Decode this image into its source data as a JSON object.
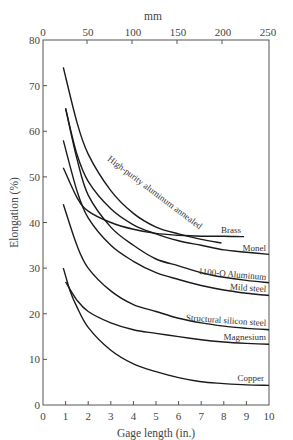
{
  "chart_data": {
    "type": "line",
    "title": "",
    "xlabel": "Gage length (in.)",
    "ylabel": "Elongation (%)",
    "x2label": "mm",
    "xlim": [
      0,
      10
    ],
    "ylim": [
      0,
      80
    ],
    "x2lim": [
      0,
      250
    ],
    "xticks": [
      0,
      1,
      2,
      3,
      4,
      5,
      6,
      7,
      8,
      9,
      10
    ],
    "yticks": [
      0,
      10,
      20,
      30,
      40,
      50,
      60,
      70,
      80
    ],
    "x2ticks": [
      0,
      50,
      100,
      150,
      200,
      250
    ],
    "grid": false,
    "legend": "inline labels at curve ends",
    "series": [
      {
        "name": "High-purity aluminum annealed",
        "x": [
          0.9,
          1.5,
          2,
          3,
          4,
          5,
          6,
          7,
          7.9
        ],
        "y": [
          74,
          62,
          55,
          47,
          42,
          39,
          37.5,
          36.3,
          35.5
        ]
      },
      {
        "name": "Brass",
        "x": [
          0.9,
          1.5,
          2,
          3,
          4,
          5,
          6,
          7,
          8,
          8.9
        ],
        "y": [
          52,
          45.5,
          42.5,
          40,
          38.5,
          37.6,
          37.2,
          37,
          37,
          36.9
        ]
      },
      {
        "name": "Monel",
        "x": [
          1,
          1.5,
          2,
          3,
          4,
          5,
          6,
          7,
          8,
          9,
          10
        ],
        "y": [
          65,
          55,
          49,
          43,
          39.5,
          37.5,
          36,
          35,
          34,
          33.5,
          33
        ]
      },
      {
        "name": "1100-O Aluminum",
        "x": [
          1,
          1.5,
          2,
          3,
          4,
          5,
          6,
          7,
          8,
          9,
          10
        ],
        "y": [
          65,
          54,
          46,
          39,
          35,
          32,
          30.5,
          29,
          28,
          27.3,
          26.8
        ]
      },
      {
        "name": "Mild steel",
        "x": [
          0.9,
          1.5,
          2,
          3,
          4,
          5,
          6,
          7,
          8,
          9,
          10
        ],
        "y": [
          58,
          47,
          41,
          35,
          31.5,
          29,
          27.5,
          26.2,
          25.2,
          24.5,
          24
        ]
      },
      {
        "name": "Structural silicon steel",
        "x": [
          0.9,
          1.5,
          2,
          3,
          4,
          5,
          6,
          7,
          8,
          9,
          10
        ],
        "y": [
          44,
          35,
          30,
          25,
          22,
          20.5,
          19,
          18,
          17.3,
          16.8,
          16.5
        ]
      },
      {
        "name": "Magnesium",
        "x": [
          1,
          1.5,
          2,
          3,
          4,
          5,
          6,
          7,
          8,
          9,
          10
        ],
        "y": [
          27,
          23,
          20.5,
          18,
          16.5,
          15.7,
          15,
          14.3,
          13.8,
          13.5,
          13.3
        ]
      },
      {
        "name": "Copper",
        "x": [
          0.9,
          1.2,
          1.5,
          2,
          3,
          4,
          5,
          6,
          7,
          8,
          9,
          10
        ],
        "y": [
          30,
          25,
          21.5,
          17,
          12,
          9,
          7.3,
          6,
          5.1,
          4.7,
          4.4,
          4.3
        ]
      }
    ]
  }
}
